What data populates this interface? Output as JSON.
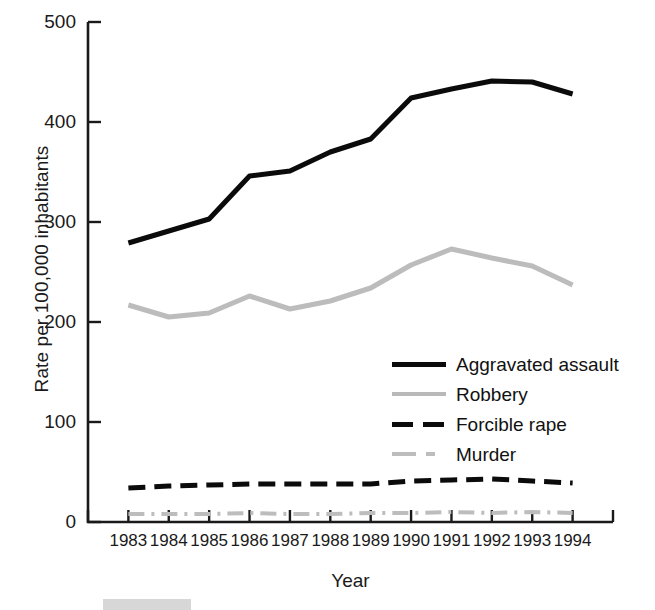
{
  "chart_data": {
    "type": "line",
    "title": "",
    "xlabel": "Year",
    "ylabel": "Rate per 100,000 inhabitants",
    "categories": [
      "1983",
      "1984",
      "1985",
      "1986",
      "1987",
      "1988",
      "1989",
      "1990",
      "1991",
      "1992",
      "1993",
      "1994"
    ],
    "x": [
      1983,
      1984,
      1985,
      1986,
      1987,
      1988,
      1989,
      1990,
      1991,
      1992,
      1993,
      1994
    ],
    "ylim": [
      0,
      500
    ],
    "xlim": [
      1982.5,
      1994.5
    ],
    "yticks": [
      0,
      100,
      200,
      300,
      400,
      500
    ],
    "ytick_labels": [
      "0",
      "100",
      "200",
      "300",
      "400",
      "500"
    ],
    "grid": false,
    "legend_position": "center-right",
    "series": [
      {
        "name": "Aggravated assault",
        "color": "#0b0b0b",
        "style": "solid",
        "width": 5,
        "values": [
          279,
          291,
          303,
          346,
          351,
          370,
          383,
          424,
          433,
          441,
          440,
          428
        ]
      },
      {
        "name": "Robbery",
        "color": "#bcbcbc",
        "style": "solid",
        "width": 5,
        "values": [
          217,
          205,
          209,
          226,
          213,
          221,
          234,
          257,
          273,
          264,
          256,
          237
        ]
      },
      {
        "name": "Forcible rape",
        "color": "#0b0b0b",
        "style": "dashed",
        "width": 5,
        "values": [
          34,
          36,
          37,
          38,
          38,
          38,
          38,
          41,
          42,
          43,
          41,
          39
        ]
      },
      {
        "name": "Murder",
        "color": "#bdbdbd",
        "style": "dashdot",
        "width": 4,
        "values": [
          8,
          8,
          8,
          9,
          8,
          8,
          9,
          9,
          10,
          9,
          10,
          9
        ]
      }
    ]
  },
  "legend": {
    "items": [
      {
        "label": "Aggravated assault"
      },
      {
        "label": "Robbery"
      },
      {
        "label": "Forcible rape"
      },
      {
        "label": "Murder"
      }
    ]
  }
}
